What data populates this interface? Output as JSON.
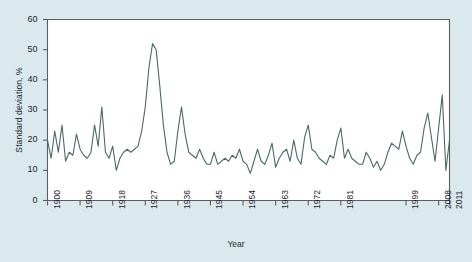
{
  "chart_data": {
    "type": "line",
    "title": "",
    "xlabel": "Year",
    "ylabel": "Standard deviation, %",
    "xlim": [
      1900,
      2011
    ],
    "ylim": [
      0,
      60
    ],
    "yticks": [
      0,
      10,
      20,
      30,
      40,
      50,
      60
    ],
    "xticks": [
      1900,
      1909,
      1918,
      1927,
      1936,
      1945,
      1954,
      1963,
      1972,
      1981,
      1999,
      2008,
      2011
    ],
    "xtick_labels": [
      "1900",
      "1909",
      "1918",
      "1927",
      "1936",
      "1945",
      "1954",
      "1963",
      "1972",
      "1981",
      "1999",
      "2008",
      "2011"
    ],
    "grid": false,
    "legend": false,
    "line_color": "#4a6b66",
    "background_color": "#dbe9ef",
    "plot_background_color": "#ffffff",
    "axis_color": "#585f63",
    "x": [
      1900,
      1901,
      1902,
      1903,
      1904,
      1905,
      1906,
      1907,
      1908,
      1909,
      1910,
      1911,
      1912,
      1913,
      1914,
      1915,
      1916,
      1917,
      1918,
      1919,
      1920,
      1921,
      1922,
      1923,
      1924,
      1925,
      1926,
      1927,
      1928,
      1929,
      1930,
      1931,
      1932,
      1933,
      1934,
      1935,
      1936,
      1937,
      1938,
      1939,
      1940,
      1941,
      1942,
      1943,
      1944,
      1945,
      1946,
      1947,
      1948,
      1949,
      1950,
      1951,
      1952,
      1953,
      1954,
      1955,
      1956,
      1957,
      1958,
      1959,
      1960,
      1961,
      1962,
      1963,
      1964,
      1965,
      1966,
      1967,
      1968,
      1969,
      1970,
      1971,
      1972,
      1973,
      1974,
      1975,
      1976,
      1977,
      1978,
      1979,
      1980,
      1981,
      1982,
      1983,
      1984,
      1985,
      1986,
      1987,
      1988,
      1989,
      1990,
      1991,
      1992,
      1993,
      1994,
      1995,
      1996,
      1997,
      1998,
      1999,
      2000,
      2001,
      2002,
      2003,
      2004,
      2005,
      2006,
      2007,
      2008,
      2009,
      2010,
      2011
    ],
    "values": [
      20,
      14,
      23,
      16,
      25,
      13,
      16,
      15,
      22,
      17,
      15,
      14,
      16,
      25,
      18,
      31,
      16,
      14,
      18,
      10,
      14,
      16,
      17,
      16,
      17,
      18,
      23,
      31,
      44,
      52,
      50,
      38,
      25,
      16,
      12,
      13,
      23,
      31,
      22,
      16,
      15,
      14,
      17,
      14,
      12,
      12,
      16,
      12,
      13,
      14,
      13,
      15,
      14,
      17,
      13,
      12,
      9,
      13,
      17,
      13,
      12,
      15,
      19,
      11,
      14,
      16,
      17,
      13,
      20,
      14,
      12,
      21,
      25,
      17,
      16,
      14,
      13,
      12,
      15,
      14,
      20,
      24,
      14,
      17,
      14,
      13,
      12,
      12,
      16,
      14,
      11,
      13,
      10,
      12,
      16,
      19,
      18,
      17,
      23,
      18,
      14,
      12,
      15,
      16,
      24,
      29,
      21,
      13,
      24,
      35,
      10,
      20
    ]
  }
}
